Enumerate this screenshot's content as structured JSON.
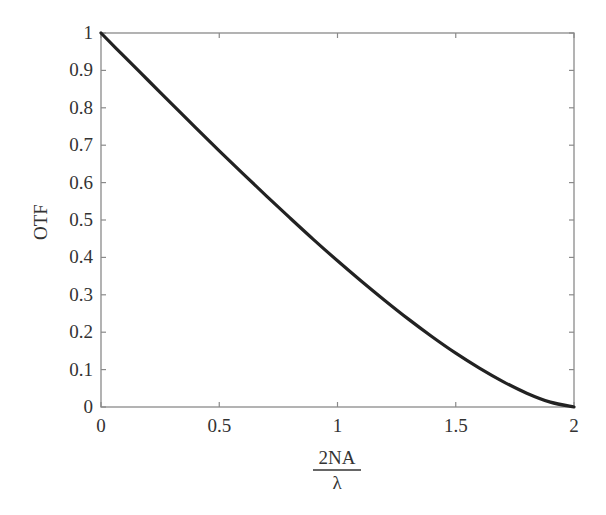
{
  "chart_data": {
    "type": "line",
    "title": "",
    "xlabel": "2NA/λ",
    "xlabel_numerator": "2NA",
    "xlabel_denominator": "λ",
    "ylabel": "OTF",
    "xlim": [
      0,
      2
    ],
    "ylim": [
      0,
      1
    ],
    "grid": false,
    "legend": null,
    "x_ticks": [
      0,
      0.5,
      1,
      1.5,
      2
    ],
    "x_tick_labels": [
      "0",
      "0.5",
      "1",
      "1.5",
      "2"
    ],
    "y_ticks": [
      0,
      0.1,
      0.2,
      0.3,
      0.4,
      0.5,
      0.6,
      0.7,
      0.8,
      0.9,
      1
    ],
    "y_tick_labels": [
      "0",
      "0.1",
      "0.2",
      "0.3",
      "0.4",
      "0.5",
      "0.6",
      "0.7",
      "0.8",
      "0.9",
      "1"
    ],
    "series": [
      {
        "name": "OTF",
        "color": "#222222",
        "x": [
          0,
          0.1,
          0.2,
          0.3,
          0.4,
          0.5,
          0.6,
          0.7,
          0.8,
          0.9,
          1.0,
          1.1,
          1.2,
          1.3,
          1.4,
          1.5,
          1.6,
          1.7,
          1.8,
          1.9,
          2.0
        ],
        "values": [
          1.0,
          0.936,
          0.873,
          0.81,
          0.747,
          0.685,
          0.624,
          0.564,
          0.505,
          0.447,
          0.391,
          0.337,
          0.285,
          0.235,
          0.188,
          0.144,
          0.104,
          0.068,
          0.037,
          0.013,
          0.0
        ]
      }
    ]
  },
  "colors": {
    "axis": "#8a8a8a",
    "curve": "#222222",
    "text": "#333333",
    "background": "#ffffff"
  }
}
